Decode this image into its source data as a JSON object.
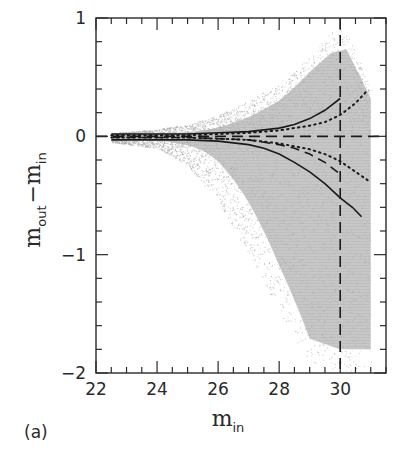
{
  "chart_data": {
    "type": "scatter",
    "title": "",
    "panel_label": "(a)",
    "xlabel": "m_in",
    "ylabel": "m_out − m_in",
    "xlim": [
      22,
      31.5
    ],
    "ylim": [
      -2,
      1
    ],
    "xticks": [
      22,
      24,
      26,
      28,
      30
    ],
    "yticks": [
      -2,
      -1,
      0,
      1
    ],
    "x_minor_step": 0.5,
    "y_minor_step": 0.2,
    "grid": false,
    "legend": null,
    "reference_lines": [
      {
        "orientation": "horizontal",
        "value": 0,
        "style": "long-dash"
      },
      {
        "orientation": "vertical",
        "value": 30,
        "style": "long-dash"
      }
    ],
    "scatter_cloud": {
      "description": "dense grey point cloud of simulated sources, narrow near m_in=22.5-26, widening toward faint magnitudes with a downward (negative) tail",
      "x_range": [
        22.5,
        31.0
      ],
      "upper_envelope": [
        [
          22.5,
          0.03
        ],
        [
          24,
          0.06
        ],
        [
          25,
          0.1
        ],
        [
          26,
          0.18
        ],
        [
          27,
          0.3
        ],
        [
          28,
          0.45
        ],
        [
          29,
          0.68
        ],
        [
          29.7,
          0.88
        ],
        [
          30.2,
          0.92
        ],
        [
          30.7,
          0.6
        ],
        [
          31.0,
          0.4
        ]
      ],
      "lower_envelope": [
        [
          22.5,
          -0.05
        ],
        [
          24,
          -0.1
        ],
        [
          25,
          -0.25
        ],
        [
          26,
          -0.55
        ],
        [
          27,
          -1.0
        ],
        [
          28,
          -1.5
        ],
        [
          29,
          -1.9
        ],
        [
          30,
          -2.0
        ],
        [
          31,
          -2.0
        ]
      ],
      "color": "#a8a8a8"
    },
    "series": [
      {
        "name": "solid-upper",
        "style": "solid",
        "x": [
          22.5,
          24,
          25,
          26,
          27,
          28,
          28.5,
          29,
          29.5,
          30.0
        ],
        "y": [
          0.02,
          0.02,
          0.02,
          0.03,
          0.04,
          0.07,
          0.1,
          0.15,
          0.22,
          0.32
        ]
      },
      {
        "name": "solid-lower",
        "style": "solid",
        "x": [
          22.5,
          24,
          25,
          26,
          27,
          27.5,
          28,
          28.5,
          29,
          29.5,
          30,
          30.4,
          30.7
        ],
        "y": [
          -0.03,
          -0.03,
          -0.03,
          -0.04,
          -0.07,
          -0.1,
          -0.15,
          -0.22,
          -0.3,
          -0.4,
          -0.52,
          -0.6,
          -0.68
        ]
      },
      {
        "name": "dotted-upper",
        "style": "dotted",
        "x": [
          22.5,
          24,
          25,
          26,
          27,
          28,
          29,
          29.5,
          30,
          30.5,
          30.9
        ],
        "y": [
          0.01,
          0.01,
          0.01,
          0.02,
          0.03,
          0.05,
          0.09,
          0.12,
          0.18,
          0.28,
          0.39
        ]
      },
      {
        "name": "dotted-lower",
        "style": "dotted",
        "x": [
          22.5,
          24,
          25,
          26,
          27,
          28,
          29,
          29.5,
          30,
          30.5,
          30.95
        ],
        "y": [
          -0.01,
          -0.01,
          -0.01,
          -0.02,
          -0.03,
          -0.06,
          -0.11,
          -0.15,
          -0.21,
          -0.3,
          -0.38
        ]
      },
      {
        "name": "dashed-median",
        "style": "dashed",
        "x": [
          22.5,
          24,
          25,
          26,
          27,
          28,
          28.5,
          29,
          29.5,
          30.0
        ],
        "y": [
          -0.01,
          -0.01,
          -0.01,
          -0.02,
          -0.03,
          -0.07,
          -0.1,
          -0.15,
          -0.22,
          -0.32
        ]
      }
    ]
  },
  "labels": {
    "panel": "(a)",
    "x_main": "m",
    "x_sub": "in",
    "y_main1": "m",
    "y_sub1": "out",
    "y_minus": "−",
    "y_main2": "m",
    "y_sub2": "in"
  },
  "colors": {
    "axis": "#2a2a2a",
    "cloud": "#a8a8a8",
    "curve": "#1a1a1a",
    "background": "#ffffff"
  }
}
